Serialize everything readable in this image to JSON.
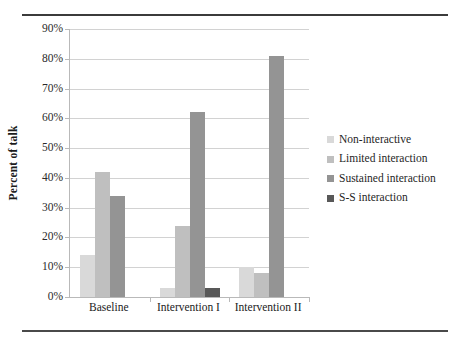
{
  "chart_data": {
    "type": "bar",
    "title": "",
    "subtitle": "",
    "xlabel": "",
    "ylabel": "Percent of talk",
    "ylim": [
      0,
      90
    ],
    "ytick_values": [
      0,
      10,
      20,
      30,
      40,
      50,
      60,
      70,
      80,
      90
    ],
    "ytick_labels": [
      "0%",
      "10%",
      "20%",
      "30%",
      "40%",
      "50%",
      "60%",
      "70%",
      "80%",
      "90%"
    ],
    "grid": true,
    "legend_position": "right",
    "categories": [
      "Baseline",
      "Intervention I",
      "Intervention II"
    ],
    "series": [
      {
        "name": "Non-interactive",
        "color": "#d9d9d9",
        "values": [
          14,
          3,
          10
        ]
      },
      {
        "name": "Limited interaction",
        "color": "#bfbfbf",
        "values": [
          42,
          24,
          8
        ]
      },
      {
        "name": "Sustained interaction",
        "color": "#949494",
        "values": [
          34,
          62,
          81
        ]
      },
      {
        "name": "S-S interaction",
        "color": "#585858",
        "values": [
          0,
          3,
          0
        ]
      }
    ],
    "annotations": []
  },
  "decor": {
    "rule_color": "#3b3b3b",
    "gridline_color": "#d2d2d2",
    "axis_color": "#b9b9b9"
  }
}
